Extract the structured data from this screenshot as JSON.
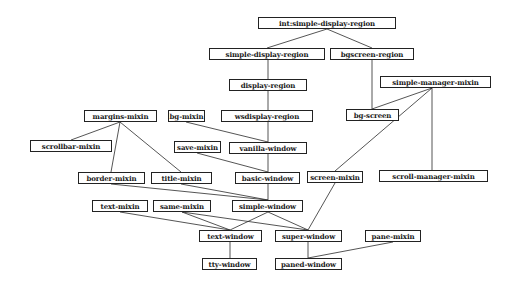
{
  "diagram": {
    "type": "class-inheritance-graph",
    "nodes": [
      {
        "id": "int-simple-display-region",
        "label": "int:simple-display-region",
        "x": 258,
        "y": 17,
        "w": 138,
        "h": 12
      },
      {
        "id": "simple-display-region",
        "label": "simple-display-region",
        "x": 209,
        "y": 48,
        "w": 116,
        "h": 12
      },
      {
        "id": "bgscreen-region",
        "label": "bgscreen-region",
        "x": 330,
        "y": 48,
        "w": 84,
        "h": 12
      },
      {
        "id": "display-region",
        "label": "display-region",
        "x": 229,
        "y": 79,
        "w": 78,
        "h": 12
      },
      {
        "id": "simple-manager-mixin",
        "label": "simple-manager-mixin",
        "x": 380,
        "y": 76,
        "w": 111,
        "h": 12
      },
      {
        "id": "margins-mixin",
        "label": "margins-mixin",
        "x": 84,
        "y": 110,
        "w": 73,
        "h": 12
      },
      {
        "id": "bg-mixin",
        "label": "bg-mixin",
        "x": 168,
        "y": 110,
        "w": 37,
        "h": 12
      },
      {
        "id": "wsdisplay-region",
        "label": "wsdisplay-region",
        "x": 221,
        "y": 110,
        "w": 92,
        "h": 12
      },
      {
        "id": "bg-screen",
        "label": "bg-screen",
        "x": 346,
        "y": 109,
        "w": 53,
        "h": 12
      },
      {
        "id": "scrollbar-mixin",
        "label": "scrollbar-mixin",
        "x": 30,
        "y": 140,
        "w": 82,
        "h": 12
      },
      {
        "id": "save-mixin",
        "label": "save-mixin",
        "x": 174,
        "y": 141,
        "w": 47,
        "h": 12
      },
      {
        "id": "vanilla-window",
        "label": "vanilla-window",
        "x": 229,
        "y": 142,
        "w": 78,
        "h": 12
      },
      {
        "id": "border-mixin",
        "label": "border-mixin",
        "x": 78,
        "y": 172,
        "w": 67,
        "h": 12
      },
      {
        "id": "title-mixin",
        "label": "title-mixin",
        "x": 151,
        "y": 172,
        "w": 61,
        "h": 12
      },
      {
        "id": "basic-window",
        "label": "basic-window",
        "x": 235,
        "y": 172,
        "w": 65,
        "h": 12
      },
      {
        "id": "screen-mixin",
        "label": "screen-mixin",
        "x": 307,
        "y": 171,
        "w": 56,
        "h": 12
      },
      {
        "id": "scroll-manager-mixin",
        "label": "scroll-manager-mixin",
        "x": 379,
        "y": 170,
        "w": 109,
        "h": 12
      },
      {
        "id": "text-mixin",
        "label": "text-mixin",
        "x": 92,
        "y": 200,
        "w": 56,
        "h": 12
      },
      {
        "id": "same-mixin",
        "label": "same-mixin",
        "x": 153,
        "y": 200,
        "w": 58,
        "h": 12
      },
      {
        "id": "simple-window",
        "label": "simple-window",
        "x": 232,
        "y": 200,
        "w": 71,
        "h": 12
      },
      {
        "id": "text-window",
        "label": "text-window",
        "x": 199,
        "y": 230,
        "w": 63,
        "h": 12
      },
      {
        "id": "super-window",
        "label": "super-window",
        "x": 275,
        "y": 230,
        "w": 67,
        "h": 12
      },
      {
        "id": "pane-mixin",
        "label": "pane-mixin",
        "x": 365,
        "y": 230,
        "w": 56,
        "h": 12
      },
      {
        "id": "tty-window",
        "label": "tty-window",
        "x": 202,
        "y": 258,
        "w": 55,
        "h": 12
      },
      {
        "id": "paned-window",
        "label": "paned-window",
        "x": 275,
        "y": 258,
        "w": 67,
        "h": 12
      }
    ],
    "edges": [
      {
        "from": "int-simple-display-region",
        "to": "simple-display-region",
        "x1": 327,
        "y1": 29,
        "x2": 267,
        "y2": 48
      },
      {
        "from": "int-simple-display-region",
        "to": "bgscreen-region",
        "x1": 327,
        "y1": 29,
        "x2": 372,
        "y2": 48
      },
      {
        "from": "simple-display-region",
        "to": "display-region",
        "x1": 268,
        "y1": 60,
        "x2": 268,
        "y2": 79
      },
      {
        "from": "bgscreen-region",
        "to": "bg-screen",
        "x1": 372,
        "y1": 60,
        "x2": 372,
        "y2": 109
      },
      {
        "from": "display-region",
        "to": "wsdisplay-region",
        "x1": 268,
        "y1": 91,
        "x2": 268,
        "y2": 110
      },
      {
        "from": "wsdisplay-region",
        "to": "vanilla-window",
        "x1": 268,
        "y1": 122,
        "x2": 268,
        "y2": 142
      },
      {
        "from": "bg-mixin",
        "to": "vanilla-window",
        "x1": 186,
        "y1": 122,
        "x2": 268,
        "y2": 142
      },
      {
        "from": "vanilla-window",
        "to": "basic-window",
        "x1": 268,
        "y1": 154,
        "x2": 268,
        "y2": 172
      },
      {
        "from": "save-mixin",
        "to": "basic-window",
        "x1": 197,
        "y1": 153,
        "x2": 268,
        "y2": 172
      },
      {
        "from": "simple-manager-mixin",
        "to": "bg-screen",
        "x1": 432,
        "y1": 88,
        "x2": 372,
        "y2": 109
      },
      {
        "from": "simple-manager-mixin",
        "to": "screen-mixin",
        "x1": 432,
        "y1": 88,
        "x2": 335,
        "y2": 171
      },
      {
        "from": "simple-manager-mixin",
        "to": "scroll-manager-mixin",
        "x1": 432,
        "y1": 88,
        "x2": 432,
        "y2": 170
      },
      {
        "from": "margins-mixin",
        "to": "scrollbar-mixin",
        "x1": 120,
        "y1": 122,
        "x2": 71,
        "y2": 140
      },
      {
        "from": "margins-mixin",
        "to": "border-mixin",
        "x1": 120,
        "y1": 122,
        "x2": 111,
        "y2": 172
      },
      {
        "from": "margins-mixin",
        "to": "title-mixin",
        "x1": 120,
        "y1": 122,
        "x2": 181,
        "y2": 172
      },
      {
        "from": "basic-window",
        "to": "simple-window",
        "x1": 268,
        "y1": 184,
        "x2": 268,
        "y2": 200
      },
      {
        "from": "border-mixin",
        "to": "simple-window",
        "x1": 111,
        "y1": 184,
        "x2": 268,
        "y2": 200
      },
      {
        "from": "title-mixin",
        "to": "simple-window",
        "x1": 181,
        "y1": 184,
        "x2": 268,
        "y2": 200
      },
      {
        "from": "simple-window",
        "to": "text-window",
        "x1": 268,
        "y1": 212,
        "x2": 230,
        "y2": 230
      },
      {
        "from": "simple-window",
        "to": "super-window",
        "x1": 268,
        "y1": 212,
        "x2": 308,
        "y2": 230
      },
      {
        "from": "text-mixin",
        "to": "text-window",
        "x1": 120,
        "y1": 212,
        "x2": 230,
        "y2": 230
      },
      {
        "from": "same-mixin",
        "to": "text-window",
        "x1": 182,
        "y1": 212,
        "x2": 230,
        "y2": 230
      },
      {
        "from": "same-mixin",
        "to": "super-window",
        "x1": 182,
        "y1": 212,
        "x2": 308,
        "y2": 230
      },
      {
        "from": "screen-mixin",
        "to": "super-window",
        "x1": 335,
        "y1": 183,
        "x2": 308,
        "y2": 230
      },
      {
        "from": "text-window",
        "to": "tty-window",
        "x1": 230,
        "y1": 242,
        "x2": 230,
        "y2": 258
      },
      {
        "from": "super-window",
        "to": "paned-window",
        "x1": 308,
        "y1": 242,
        "x2": 308,
        "y2": 258
      },
      {
        "from": "pane-mixin",
        "to": "paned-window",
        "x1": 393,
        "y1": 242,
        "x2": 308,
        "y2": 258
      }
    ]
  }
}
